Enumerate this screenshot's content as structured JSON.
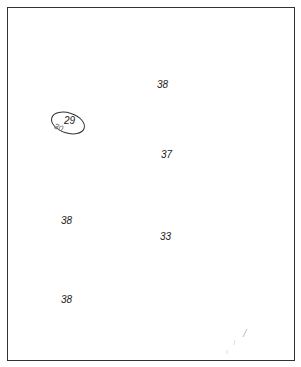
{
  "map": {
    "labels": [
      {
        "text": "38",
        "x": 157,
        "y": 80
      },
      {
        "text": "29",
        "x": 64,
        "y": 116
      },
      {
        "text": "30",
        "x": 54,
        "y": 124
      },
      {
        "text": "37",
        "x": 161,
        "y": 150
      },
      {
        "text": "38",
        "x": 61,
        "y": 216
      },
      {
        "text": "33",
        "x": 160,
        "y": 232
      },
      {
        "text": "38",
        "x": 61,
        "y": 295
      }
    ],
    "contour_value": "30",
    "spot_value": "29"
  }
}
